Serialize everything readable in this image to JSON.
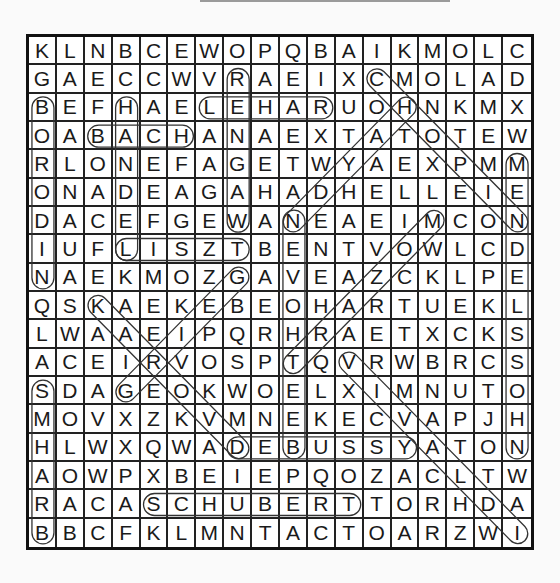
{
  "puzzle": {
    "rows": 18,
    "cols": 18,
    "grid": [
      "KLNBCEWOPQBAIKMOLC",
      "GAECCWVRAEIXCMOLAD",
      "BEFHAELEHARUOHNKMX",
      "OABACHANAEXTATOTEW",
      "RLONEFAGETWYAEXPMM",
      "ONADEAGAHADHELLEIE",
      "DACEFGEWANEAEIMCON",
      "IUFLISZTBENTVOWLCD",
      "NAEKMOZGAVEAZCKLPE",
      "QSKAEKEBEOHARTUEKL",
      "LWAAEIPQRHRAETXCKS",
      "ACEIRVOSPTQVRWBRCS",
      "SDAGEOKWOELXIMNUTO",
      "MOVXZKVMNEKECVAPJH",
      "HLWXQWADEBUSSYATON",
      "AOWPXBEIEPQOZACLTW",
      "RACASCHUBERTTORHDA",
      "BBCFKLMNTACTOARZWI"
    ],
    "found_words": [
      {
        "word": "BORODIN",
        "start": [
          2,
          0
        ],
        "end": [
          8,
          0
        ]
      },
      {
        "word": "BRAHMS",
        "start": [
          17,
          0
        ],
        "end": [
          12,
          0
        ]
      },
      {
        "word": "HANDEL",
        "start": [
          2,
          3
        ],
        "end": [
          7,
          3
        ]
      },
      {
        "word": "BACH",
        "start": [
          3,
          2
        ],
        "end": [
          3,
          5
        ]
      },
      {
        "word": "LEHAR",
        "start": [
          2,
          6
        ],
        "end": [
          2,
          10
        ]
      },
      {
        "word": "WAGNER",
        "start": [
          6,
          7
        ],
        "end": [
          1,
          7
        ]
      },
      {
        "word": "LISZT",
        "start": [
          7,
          3
        ],
        "end": [
          7,
          7
        ]
      },
      {
        "word": "HAYDN",
        "start": [
          2,
          13
        ],
        "end": [
          6,
          9
        ]
      },
      {
        "word": "CHOPIN",
        "start": [
          1,
          12
        ],
        "end": [
          6,
          17
        ]
      },
      {
        "word": "MENDELSSOHN",
        "start": [
          4,
          17
        ],
        "end": [
          14,
          17
        ]
      },
      {
        "word": "BEETHOVEN",
        "start": [
          14,
          9
        ],
        "end": [
          6,
          9
        ]
      },
      {
        "word": "MOZART",
        "start": [
          6,
          14
        ],
        "end": [
          11,
          9
        ]
      },
      {
        "word": "GRIEG",
        "start": [
          12,
          3
        ],
        "end": [
          8,
          7
        ]
      },
      {
        "word": "DVORAK",
        "start": [
          14,
          7
        ],
        "end": [
          9,
          2
        ]
      },
      {
        "word": "VIVALDI",
        "start": [
          11,
          11
        ],
        "end": [
          17,
          17
        ]
      },
      {
        "word": "DEBUSSY",
        "start": [
          14,
          7
        ],
        "end": [
          14,
          13
        ]
      },
      {
        "word": "SCHUBERT",
        "start": [
          16,
          4
        ],
        "end": [
          16,
          11
        ]
      }
    ]
  }
}
